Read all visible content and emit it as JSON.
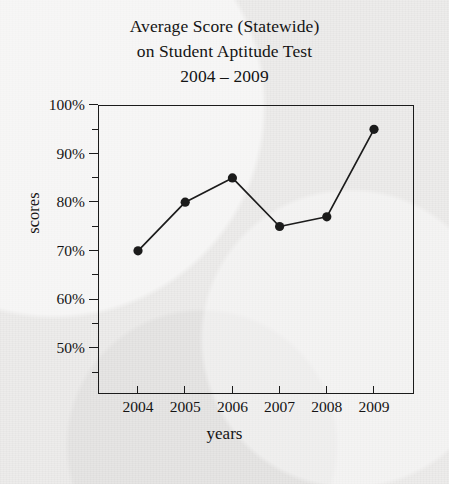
{
  "chart_data": {
    "type": "line",
    "title": "Average Score (Statewide) on Student Aptitude Test 2004 – 2009",
    "title_lines": [
      "Average Score (Statewide)",
      "on Student Aptitude Test",
      "2004 – 2009"
    ],
    "xlabel": "years",
    "ylabel": "scores",
    "categories": [
      "2004",
      "2005",
      "2006",
      "2007",
      "2008",
      "2009"
    ],
    "x": [
      2004,
      2005,
      2006,
      2007,
      2008,
      2009
    ],
    "values": [
      70,
      80,
      85,
      75,
      77,
      95
    ],
    "point_labels": [
      "70%",
      "80%",
      "85%",
      "75%",
      "77%",
      "95%"
    ],
    "ylim": [
      40,
      100
    ],
    "ytick_values": [
      100,
      90,
      80,
      70,
      60,
      50
    ],
    "ytick_labels": [
      "100%",
      "90%",
      "80%",
      "70%",
      "60%",
      "50%"
    ],
    "yminor_values": [
      95,
      85,
      75,
      65,
      55,
      45
    ],
    "grid": false,
    "legend": null,
    "marker": "filled-circle",
    "line_color": "#1b1b1b",
    "marker_color": "#1b1b1b",
    "background_color": "#edeceb",
    "axis_color": "#1b1b1b"
  }
}
